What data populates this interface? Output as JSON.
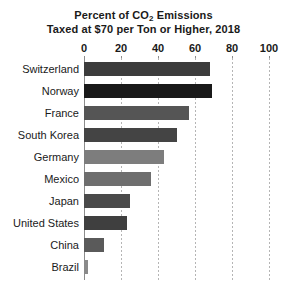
{
  "chart_data": {
    "type": "bar",
    "orientation": "horizontal",
    "title": "Percent of CO2 Emissions Taxed at $70 per Ton or Higher, 2018",
    "title_lines": [
      {
        "pre": "Percent of CO",
        "sub": "2",
        "post": " Emissions"
      },
      {
        "pre": "Taxed at $70 per Ton or Higher, 2018",
        "sub": "",
        "post": ""
      }
    ],
    "xlabel": "",
    "ylabel": "",
    "xlim": [
      0,
      100
    ],
    "xticks": [
      0,
      20,
      40,
      60,
      80,
      100
    ],
    "xtick_labels": [
      "0",
      "20",
      "40",
      "60",
      "80",
      "100"
    ],
    "grid": "vertical-dotted",
    "legend": "none",
    "categories": [
      "Switzerland",
      "Norway",
      "France",
      "South Korea",
      "Germany",
      "Mexico",
      "Japan",
      "United States",
      "China",
      "Brazil"
    ],
    "values": [
      68,
      69,
      57,
      50,
      43,
      36,
      25,
      23,
      11,
      2
    ],
    "bar_colors": [
      "#3c3c3c",
      "#191919",
      "#555555",
      "#444444",
      "#7d7d7d",
      "#6e6e6e",
      "#4a4a4a",
      "#3f3f3f",
      "#5a5a5a",
      "#8a8a8a"
    ]
  },
  "colors": {
    "background": "#ffffff",
    "text": "#1a1a1a",
    "axis": "#8c8c8c",
    "gridline": "#b5b5b5"
  }
}
